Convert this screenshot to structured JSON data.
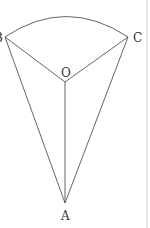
{
  "diagram": {
    "type": "geometry-sector-pyramid",
    "colors": {
      "line": "#555555",
      "label": "#333333",
      "border": "#e6e6e6"
    },
    "points": {
      "B": {
        "label": "B",
        "x": 5,
        "y": 37
      },
      "C": {
        "label": "C",
        "x": 128,
        "y": 37
      },
      "O": {
        "label": "O",
        "x": 65,
        "y": 82
      },
      "A": {
        "label": "A",
        "x": 65,
        "y": 203
      }
    },
    "labels": {
      "B": "B",
      "C": "C",
      "O": "O",
      "A": "A"
    },
    "segments": [
      "BO",
      "OC",
      "OA",
      "BA",
      "CA"
    ],
    "arc": "BC (circular arc centered near O)"
  }
}
